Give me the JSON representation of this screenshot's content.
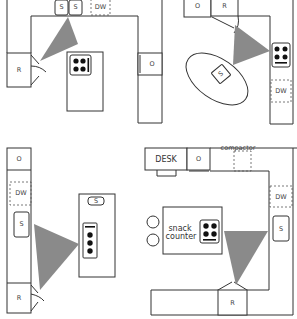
{
  "diagram": {
    "type": "kitchen work-triangle layouts",
    "colors": {
      "line": "#333333",
      "triangle": "#8a8a8a",
      "burner": "#111111",
      "background": "#ffffff"
    },
    "layouts": [
      {
        "id": "u-shape-island",
        "labels": {
          "sink1": "S",
          "sink2": "S",
          "dishwasher": "DW",
          "refrigerator": "R",
          "oven": "O"
        }
      },
      {
        "id": "l-shape-oval-island",
        "labels": {
          "oven": "O",
          "refrigerator": "R",
          "sink": "S",
          "dishwasher": "DW"
        }
      },
      {
        "id": "galley-island",
        "labels": {
          "oven": "O",
          "dishwasher": "DW",
          "sink": "S",
          "refrigerator": "R",
          "island_sink": "S"
        }
      },
      {
        "id": "u-shape-snack-counter",
        "labels": {
          "desk": "DESK",
          "oven": "O",
          "compactor": "compactor",
          "dishwasher": "DW",
          "sink": "S",
          "refrigerator": "R",
          "snack_line1": "snack",
          "snack_line2": "counter"
        }
      }
    ]
  }
}
